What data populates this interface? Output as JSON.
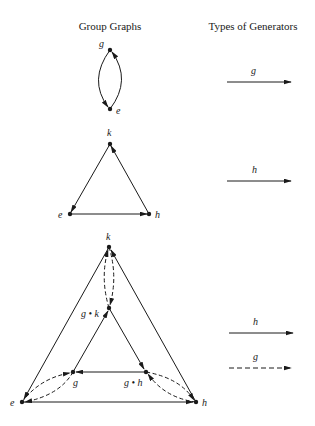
{
  "headers": {
    "left": "Group Graphs",
    "right": "Types of Generators"
  },
  "graph1": {
    "nodes": [
      {
        "id": "g",
        "label": "g",
        "x": 110,
        "y": 50
      },
      {
        "id": "e",
        "label": "e",
        "x": 110,
        "y": 109
      }
    ],
    "edges": [
      {
        "from": "g",
        "to": "e",
        "type": "g",
        "curve": "left"
      },
      {
        "from": "e",
        "to": "g",
        "type": "g",
        "curve": "right"
      }
    ]
  },
  "graph2": {
    "nodes": [
      {
        "id": "k",
        "label": "k",
        "x": 110,
        "y": 144
      },
      {
        "id": "e",
        "label": "e",
        "x": 70,
        "y": 214
      },
      {
        "id": "h",
        "label": "h",
        "x": 149,
        "y": 214
      }
    ],
    "edges": [
      {
        "from": "k",
        "to": "e",
        "type": "h"
      },
      {
        "from": "e",
        "to": "h",
        "type": "h"
      },
      {
        "from": "h",
        "to": "k",
        "type": "h"
      }
    ]
  },
  "graph3": {
    "nodes": [
      {
        "id": "k",
        "label": "k",
        "x": 109,
        "y": 247
      },
      {
        "id": "gk",
        "label": "g • k",
        "x": 109,
        "y": 308
      },
      {
        "id": "g",
        "label": "g",
        "x": 73,
        "y": 372
      },
      {
        "id": "gh",
        "label": "g • h",
        "x": 146,
        "y": 372
      },
      {
        "id": "e",
        "label": "e",
        "x": 22,
        "y": 402
      },
      {
        "id": "h",
        "label": "h",
        "x": 196,
        "y": 402
      }
    ]
  },
  "legend": [
    {
      "section": 1,
      "generator": "g",
      "style": "solid"
    },
    {
      "section": 2,
      "generator": "h",
      "style": "solid"
    },
    {
      "section": 3,
      "generator": "h",
      "style": "solid"
    },
    {
      "section": 3,
      "generator": "g",
      "style": "dashed"
    }
  ],
  "colors": {
    "ink": "#1a1a1a",
    "background": "#ffffff"
  }
}
